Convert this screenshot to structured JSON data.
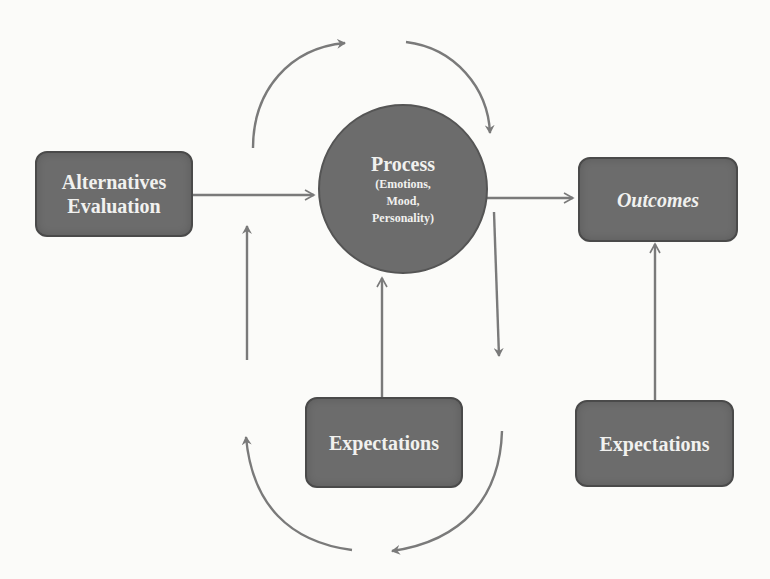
{
  "diagram": {
    "nodes": {
      "alternatives": {
        "line1": "Alternatives",
        "line2": "Evaluation"
      },
      "process": {
        "title": "Process",
        "sub1": "(Emotions,",
        "sub2": "Mood,",
        "sub3": "Personality)"
      },
      "outcomes": {
        "label": "Outcomes"
      },
      "expectations_middle": {
        "label": "Expectations"
      },
      "expectations_right": {
        "label": "Expectations"
      }
    },
    "edges": [
      {
        "from": "Alternatives Evaluation",
        "to": "Process",
        "type": "straight"
      },
      {
        "from": "Process",
        "to": "Outcomes",
        "type": "straight"
      },
      {
        "from": "Expectations (middle)",
        "to": "Process",
        "type": "straight"
      },
      {
        "from": "Expectations (right)",
        "to": "Outcomes",
        "type": "straight"
      },
      {
        "from": "left side",
        "to": "top",
        "type": "curved feedback loop (top-left)"
      },
      {
        "from": "top",
        "to": "Process",
        "type": "curved feedback loop (top-right)"
      },
      {
        "from": "Process",
        "to": "below right",
        "type": "straight downward"
      },
      {
        "from": "below",
        "to": "up left",
        "type": "straight upward"
      },
      {
        "from": "bottom left",
        "to": "bottom center",
        "type": "curved loop (bottom-left)"
      },
      {
        "from": "bottom right",
        "to": "bottom center",
        "type": "curved loop (bottom-right)"
      }
    ],
    "colors": {
      "node_fill": "#6c6c6c",
      "node_text": "#f1f1ef",
      "arrow": "#7a7a7a",
      "background": "#fbfbf9"
    }
  }
}
